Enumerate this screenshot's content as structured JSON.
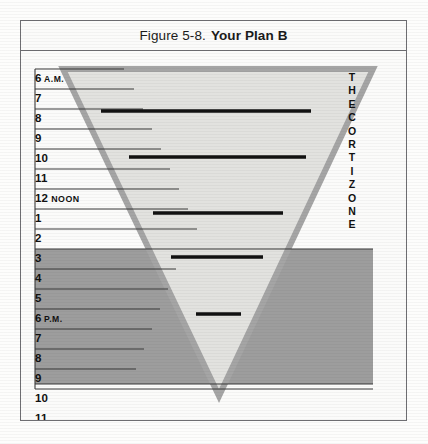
{
  "figure": {
    "caption_number": "Figure 5-8.",
    "caption_title": "Your Plan B",
    "colors": {
      "triangle_outline": "#a5a5a5",
      "triangle_fill": "#e9e9e7",
      "cortizone_band": "#9d9d9d",
      "bar": "#111111",
      "frame": "#6e6e72",
      "page": "#fbfbfa",
      "hour_rule": "#3a3a3a"
    }
  },
  "hours": [
    {
      "label": "6",
      "meridiem": "A.M.",
      "noon": ""
    },
    {
      "label": "7",
      "meridiem": "",
      "noon": ""
    },
    {
      "label": "8",
      "meridiem": "",
      "noon": ""
    },
    {
      "label": "9",
      "meridiem": "",
      "noon": ""
    },
    {
      "label": "10",
      "meridiem": "",
      "noon": ""
    },
    {
      "label": "11",
      "meridiem": "",
      "noon": ""
    },
    {
      "label": "12",
      "meridiem": "",
      "noon": "NOON"
    },
    {
      "label": "1",
      "meridiem": "",
      "noon": ""
    },
    {
      "label": "2",
      "meridiem": "",
      "noon": ""
    },
    {
      "label": "3",
      "meridiem": "",
      "noon": ""
    },
    {
      "label": "4",
      "meridiem": "",
      "noon": ""
    },
    {
      "label": "5",
      "meridiem": "",
      "noon": ""
    },
    {
      "label": "6",
      "meridiem": "P.M.",
      "noon": ""
    },
    {
      "label": "7",
      "meridiem": "",
      "noon": ""
    },
    {
      "label": "8",
      "meridiem": "",
      "noon": ""
    },
    {
      "label": "9",
      "meridiem": "",
      "noon": ""
    },
    {
      "label": "10",
      "meridiem": "",
      "noon": ""
    },
    {
      "label": "11",
      "meridiem": "",
      "noon": ""
    }
  ],
  "cortizone": {
    "line1": "THE",
    "line2": "CORTIZONE"
  },
  "chart_data": {
    "type": "diagram",
    "axis": {
      "orientation": "vertical",
      "ylabel": "Time of day",
      "ticks": [
        "6 A.M.",
        "7",
        "8",
        "9",
        "10",
        "11",
        "12 NOON",
        "1",
        "2",
        "3",
        "4",
        "5",
        "6 P.M.",
        "7",
        "8",
        "9",
        "10",
        "11"
      ],
      "row_height_px": 20,
      "ylim_top": "6 A.M.",
      "ylim_bottom": "11 P.M."
    },
    "triangle": {
      "shape": "inverted-triangle",
      "top_left": [
        42,
        18
      ],
      "top_right": [
        352,
        18
      ],
      "apex": [
        198,
        345
      ],
      "outline_color": "#a5a5a5",
      "fill_color": "#e9e9e7"
    },
    "cortizone_band": {
      "label": "THE CORTIZONE",
      "start_hour": "4 P.M.",
      "end_hour": "11 P.M.",
      "top_px": 198,
      "bottom_px": 333,
      "color": "#9d9d9d"
    },
    "bars": [
      {
        "hour": "8",
        "x_start": 80,
        "x_end": 290,
        "y": 60
      },
      {
        "hour": "11",
        "x_start": 108,
        "x_end": 285,
        "y": 106
      },
      {
        "hour": "2",
        "x_start": 132,
        "x_end": 262,
        "y": 162
      },
      {
        "hour": "4",
        "x_start": 150,
        "x_end": 242,
        "y": 206
      },
      {
        "hour": "7 P.M.",
        "x_start": 175,
        "x_end": 220,
        "y": 263
      }
    ]
  }
}
